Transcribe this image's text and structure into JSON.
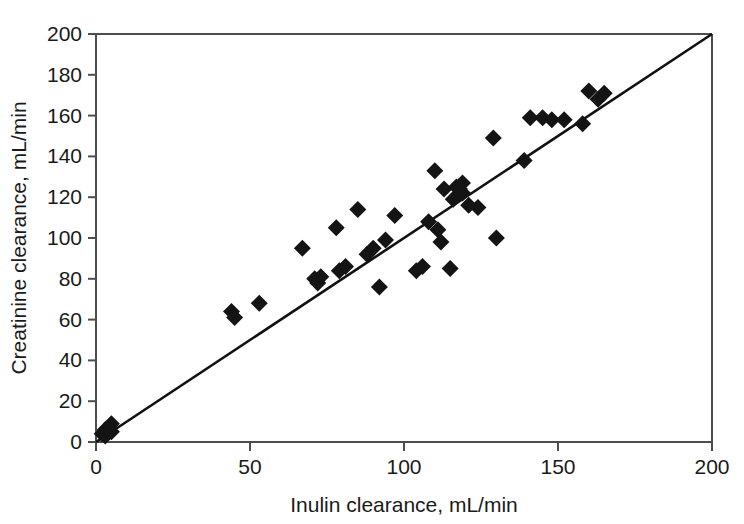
{
  "chart_data": {
    "type": "scatter",
    "title": "",
    "xlabel": "Inulin clearance, mL/min",
    "ylabel": "Creatinine clearance, mL/min",
    "xlim": [
      0,
      200
    ],
    "ylim": [
      0,
      200
    ],
    "xticks": [
      0,
      50,
      100,
      150,
      200
    ],
    "yticks": [
      0,
      20,
      40,
      60,
      80,
      100,
      120,
      140,
      160,
      180,
      200
    ],
    "xtick_labels": [
      "0",
      "50",
      "100",
      "150",
      "200"
    ],
    "ytick_labels": [
      "0",
      "20",
      "40",
      "60",
      "80",
      "100",
      "120",
      "140",
      "160",
      "180",
      "200"
    ],
    "grid": false,
    "legend": null,
    "marker_style": "filled-diamond",
    "marker_color": "#141414",
    "reference_line": {
      "name": "line-of-identity",
      "type": "line",
      "x": [
        0,
        200
      ],
      "y": [
        0,
        200
      ],
      "color": "#111111"
    },
    "series": [
      {
        "name": "patients",
        "points": [
          [
            2,
            4
          ],
          [
            3,
            6
          ],
          [
            3,
            3
          ],
          [
            4,
            7
          ],
          [
            5,
            9
          ],
          [
            5,
            5
          ],
          [
            44,
            64
          ],
          [
            45,
            61
          ],
          [
            53,
            68
          ],
          [
            67,
            95
          ],
          [
            71,
            80
          ],
          [
            72,
            78
          ],
          [
            73,
            81
          ],
          [
            78,
            105
          ],
          [
            79,
            84
          ],
          [
            81,
            86
          ],
          [
            85,
            114
          ],
          [
            88,
            92
          ],
          [
            90,
            95
          ],
          [
            92,
            76
          ],
          [
            94,
            99
          ],
          [
            97,
            111
          ],
          [
            104,
            84
          ],
          [
            106,
            86
          ],
          [
            108,
            108
          ],
          [
            110,
            133
          ],
          [
            111,
            104
          ],
          [
            112,
            98
          ],
          [
            113,
            124
          ],
          [
            115,
            85
          ],
          [
            116,
            119
          ],
          [
            117,
            125
          ],
          [
            118,
            124
          ],
          [
            119,
            122
          ],
          [
            119,
            127
          ],
          [
            121,
            116
          ],
          [
            124,
            115
          ],
          [
            129,
            149
          ],
          [
            130,
            100
          ],
          [
            139,
            138
          ],
          [
            141,
            159
          ],
          [
            145,
            159
          ],
          [
            148,
            158
          ],
          [
            152,
            158
          ],
          [
            158,
            156
          ],
          [
            160,
            172
          ],
          [
            163,
            168
          ],
          [
            165,
            171
          ]
        ]
      }
    ]
  },
  "axes": {
    "x_title": "Inulin clearance, mL/min",
    "y_title": "Creatinine clearance, mL/min"
  }
}
